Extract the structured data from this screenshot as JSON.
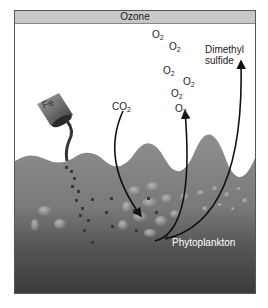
{
  "diagram": {
    "ozone_label": "Ozone",
    "iron_label": "Fe",
    "co2_label": "CO",
    "co2_sub": "2",
    "o2_label": "O",
    "o2_sub": "2",
    "o2_positions": [
      [
        151,
        23
      ],
      [
        168,
        30
      ],
      [
        162,
        54
      ],
      [
        182,
        61
      ],
      [
        169,
        74
      ],
      [
        174,
        88
      ]
    ],
    "dms_label_line1": "Dimethyl",
    "dms_label_line2": "sulfide",
    "phytoplankton_label": "Phytoplankton",
    "colors": {
      "ozone_bar": "#c8c8c8",
      "water_top": "#8a8a8a",
      "water_bottom": "#3c3c3c",
      "arrow": "#111111",
      "iron_particle": "#3a3a3a"
    }
  }
}
